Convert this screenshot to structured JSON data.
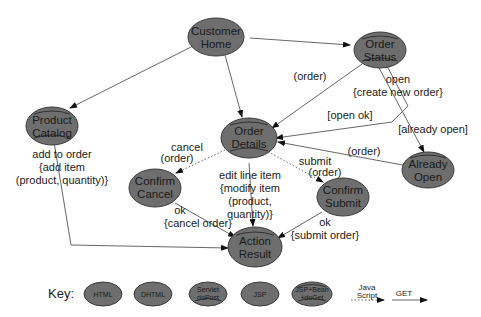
{
  "diagram": {
    "nodes": {
      "customer_home": {
        "line1": "Customer",
        "line2": "Home",
        "type": "DHTML"
      },
      "order_status": {
        "line1": "Order",
        "line2": "Status",
        "type": "JSP+Bean+doGet"
      },
      "product_catalog": {
        "line1": "Product",
        "line2": "Catalog",
        "type": "JSP+Bean+doGet"
      },
      "order_details": {
        "line1": "Order",
        "line2": "Details",
        "type": "JSP+Bean+doGet"
      },
      "confirm_cancel": {
        "line1": "Confirm",
        "line2": "Cancel",
        "type": "JSP"
      },
      "confirm_submit": {
        "line1": "Confirm",
        "line2": "Submit",
        "type": "JSP"
      },
      "already_open": {
        "line1": "Already",
        "line2": "Open",
        "type": "Servlet doPost"
      },
      "action_result": {
        "line1": "Action",
        "line2": "Result",
        "type": "Servlet doPost"
      }
    },
    "edge_labels": {
      "order_status_to_details": "(order)",
      "open_l1": "open",
      "open_l2": "{create new order}",
      "open_ok": "[open ok]",
      "already_open": "[already open]",
      "already_to_details": "(order)",
      "add_l1": "add to order",
      "add_l2": "{add item",
      "add_l3": "(product, quantity)}",
      "cancel_l1": "cancel",
      "cancel_l2": "(order)",
      "edit_l1": "edit line item",
      "edit_l2": "{modify item",
      "edit_l3": "(product,",
      "edit_l4": "quantity)}",
      "submit_l1": "submit",
      "submit_l2": "(order)",
      "ok_cancel_l1": "ok",
      "ok_cancel_l2": "{cancel order}",
      "ok_submit_l1": "ok",
      "ok_submit_l2": "{submit order}"
    },
    "key": {
      "title": "Key:",
      "html": "HTML",
      "dhtml": "DHTML",
      "servlet_l1": "Servlet",
      "servlet_l2": "doPost",
      "jsp": "JSP",
      "jspbean_l1": "JSP+Bean",
      "jspbean_l2": "+doGet",
      "js_l1": "Java",
      "js_l2": "Script",
      "get": "GET"
    },
    "colors": {
      "node_fill": "#6e6e6e",
      "edge": "#555555",
      "text": "#1a1a1a"
    }
  }
}
